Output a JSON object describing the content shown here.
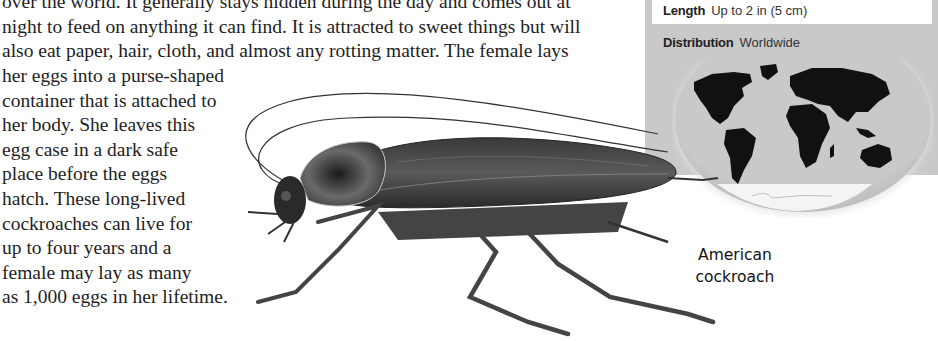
{
  "article": {
    "wide_lines": [
      "over the world. It generally stays hidden during the day and comes out at",
      "night to feed on anything it can find. It is attracted to sweet things but will",
      "also eat paper, hair, cloth, and almost any rotting matter. The female lays"
    ],
    "narrow_lines": [
      "her eggs into a purse-shaped",
      "container that is attached to",
      "her body. She leaves this",
      "egg case in a dark safe",
      "place before the eggs",
      "hatch. These long-lived",
      "cockroaches can live for",
      "up to four years and a",
      "female may lay as many",
      "as 1,000 eggs in her lifetime."
    ]
  },
  "fact_panel": {
    "length": {
      "label": "Length",
      "value": "Up to 2 in (5 cm)"
    },
    "distribution": {
      "label": "Distribution",
      "value": "Worldwide"
    },
    "map_icon": "world-map-icon",
    "colors": {
      "panel": "#c9c9c9",
      "land": "#111111",
      "box": "#ffffff"
    }
  },
  "illustration": {
    "subject_icon": "cockroach-illustration",
    "caption_line1": "American",
    "caption_line2": "cockroach"
  }
}
